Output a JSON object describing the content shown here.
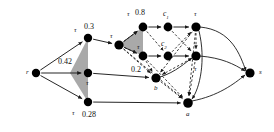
{
  "figure": {
    "type": "directed-graph-diagram",
    "background": "#ffffff",
    "stroke": "#1a1a1a",
    "node_fill": "#000000",
    "shade_fill": "#9a9a9a",
    "width": 274,
    "height": 132
  },
  "nodes": [
    {
      "id": "r",
      "label": "r",
      "x": 36,
      "y": 73,
      "r": 4.2,
      "label_dx": -9,
      "label_dy": -4
    },
    {
      "id": "n1",
      "label": "",
      "x": 88,
      "y": 38,
      "r": 4.2,
      "label_dx": 0,
      "label_dy": 0
    },
    {
      "id": "n2",
      "label": "",
      "x": 88,
      "y": 73,
      "r": 4.2,
      "label_dx": 0,
      "label_dy": 0
    },
    {
      "id": "n3",
      "label": "",
      "x": 88,
      "y": 102,
      "r": 4.2,
      "label_dx": 0,
      "label_dy": 0
    },
    {
      "id": "hub",
      "label": "",
      "x": 119,
      "y": 45,
      "r": 4.6,
      "label_dx": 0,
      "label_dy": 0
    },
    {
      "id": "t08",
      "label": "",
      "x": 143,
      "y": 27,
      "r": 4.4,
      "label_dx": 0,
      "label_dy": 0
    },
    {
      "id": "t2",
      "label": "",
      "x": 143,
      "y": 56,
      "r": 4.4,
      "label_dx": 0,
      "label_dy": 0
    },
    {
      "id": "c1",
      "label": "",
      "x": 168,
      "y": 27,
      "r": 4.4,
      "label_dx": 0,
      "label_dy": 0
    },
    {
      "id": "c2",
      "label": "",
      "x": 168,
      "y": 56,
      "r": 4.4,
      "label_dx": 0,
      "label_dy": 0
    },
    {
      "id": "u1",
      "label": "",
      "x": 196,
      "y": 27,
      "r": 4.6,
      "label_dx": 0,
      "label_dy": 0
    },
    {
      "id": "u2",
      "label": "",
      "x": 196,
      "y": 56,
      "r": 4.6,
      "label_dx": 0,
      "label_dy": 0
    },
    {
      "id": "b",
      "label": "b",
      "x": 156,
      "y": 78,
      "r": 4.6,
      "label_dx": -2,
      "label_dy": 8
    },
    {
      "id": "a",
      "label": "a",
      "x": 188,
      "y": 103,
      "r": 4.8,
      "label_dx": -2,
      "label_dy": 9
    },
    {
      "id": "s",
      "label": "s",
      "x": 250,
      "y": 73,
      "r": 4.6,
      "label_dx": 8,
      "label_dy": -3
    }
  ],
  "labels": [
    {
      "name": "tau-03",
      "text": "τ",
      "kind": "tau",
      "x": 74,
      "y": 27
    },
    {
      "name": "val-03",
      "text": "0.3",
      "kind": "num",
      "x": 84,
      "y": 23
    },
    {
      "name": "val-042",
      "text": "0.42",
      "kind": "num",
      "x": 58,
      "y": 58
    },
    {
      "name": "tau-042",
      "text": "τ",
      "kind": "tau",
      "x": 86,
      "y": 80
    },
    {
      "name": "tau-028",
      "text": "τ",
      "kind": "tau",
      "x": 72,
      "y": 110
    },
    {
      "name": "val-028",
      "text": "0.28",
      "kind": "num",
      "x": 82,
      "y": 111
    },
    {
      "name": "tau-hub",
      "text": "τ",
      "kind": "tau",
      "x": 110,
      "y": 33
    },
    {
      "name": "tau-08",
      "text": "τ",
      "kind": "tau",
      "x": 127,
      "y": 11
    },
    {
      "name": "val-08",
      "text": "0.8",
      "kind": "num",
      "x": 135,
      "y": 9
    },
    {
      "name": "tau-mid",
      "text": "τ",
      "kind": "tau",
      "x": 137,
      "y": 44
    },
    {
      "name": "val-02",
      "text": "0.2",
      "kind": "num",
      "x": 131,
      "y": 66
    },
    {
      "name": "tau-u1",
      "text": "τ",
      "kind": "tau",
      "x": 194,
      "y": 11
    },
    {
      "name": "tau-u2",
      "text": "τ",
      "kind": "tau",
      "x": 194,
      "y": 66
    }
  ],
  "clabels": [
    {
      "name": "c1-label",
      "base": "c",
      "sub": "1",
      "x": 163,
      "y": 10
    },
    {
      "name": "c2-label",
      "base": "c",
      "sub": "2",
      "x": 161,
      "y": 40
    }
  ],
  "node_labels": [
    {
      "name": "node-label-r",
      "text": "r",
      "x": 26,
      "y": 69
    },
    {
      "name": "node-label-b",
      "text": "b",
      "x": 154,
      "y": 85
    },
    {
      "name": "node-label-a",
      "text": "a",
      "x": 186,
      "y": 111
    },
    {
      "name": "node-label-s",
      "text": "s",
      "x": 259,
      "y": 69
    }
  ],
  "solid_edges": [
    {
      "from": "r",
      "to": "n1",
      "name": "edge-r-n1"
    },
    {
      "from": "r",
      "to": "n2",
      "name": "edge-r-n2"
    },
    {
      "from": "r",
      "to": "n3",
      "name": "edge-r-n3"
    },
    {
      "from": "n1",
      "to": "hub",
      "name": "edge-n1-hub"
    },
    {
      "from": "hub",
      "to": "t08",
      "name": "edge-hub-t08"
    },
    {
      "from": "hub",
      "to": "t2",
      "name": "edge-hub-t2"
    },
    {
      "from": "t08",
      "to": "c1",
      "name": "edge-t08-c1"
    },
    {
      "from": "c1",
      "to": "u1",
      "name": "edge-c1-u1"
    },
    {
      "from": "t2",
      "to": "c2",
      "name": "edge-t2-c2"
    },
    {
      "from": "c2",
      "to": "u2",
      "name": "edge-c2-u2"
    },
    {
      "from": "n2",
      "to": "b",
      "name": "edge-n2-b"
    },
    {
      "from": "n3",
      "to": "a",
      "name": "edge-n3-a"
    }
  ],
  "dashed_edges": [
    {
      "from": "hub",
      "to": "t08",
      "name": "dashed-hub-t08"
    },
    {
      "from": "hub",
      "to": "t2",
      "name": "dashed-hub-t2"
    },
    {
      "from": "hub",
      "to": "b",
      "name": "dashed-hub-b"
    },
    {
      "from": "hub",
      "to": "a",
      "name": "dashed-hub-a"
    },
    {
      "from": "t08",
      "to": "c2",
      "name": "dashed-t08-c2"
    },
    {
      "from": "t2",
      "to": "b",
      "name": "dashed-t2-b"
    },
    {
      "from": "c1",
      "to": "u2",
      "name": "dashed-c1-u2"
    },
    {
      "from": "c2",
      "to": "u1",
      "name": "dashed-c2-u1"
    },
    {
      "from": "u1",
      "to": "u2",
      "name": "dashed-u1-u2"
    },
    {
      "from": "u1",
      "to": "b",
      "name": "dashed-u1-b"
    },
    {
      "from": "u1",
      "to": "a",
      "name": "dashed-u1-a"
    },
    {
      "from": "u2",
      "to": "a",
      "name": "dashed-u2-a"
    },
    {
      "from": "u2",
      "to": "b",
      "name": "dashed-u2-b"
    },
    {
      "from": "b",
      "to": "a",
      "name": "dashed-b-a"
    },
    {
      "from": "t2",
      "to": "a",
      "name": "dashed-t2-a"
    }
  ],
  "shaded_regions": [
    {
      "name": "shade-left-triangle",
      "points": "88,38 88,102 70,73"
    },
    {
      "name": "shade-hub-triangle",
      "points": "119,45 143,27 143,56"
    }
  ],
  "curved_edges": [
    {
      "name": "curve-u1-s",
      "d": "M 200,27 C 232,30 240,55 246,71"
    },
    {
      "name": "curve-u2-s",
      "d": "M 200,56 C 222,58 234,64 245,71"
    },
    {
      "name": "curve-a-s",
      "d": "M 192,101 C 218,96 234,84 245,75"
    },
    {
      "name": "curve-u1-a",
      "d": "M 199,31 C 206,60 200,88 192,99"
    },
    {
      "name": "curve-b-out",
      "d": "M 160,77 C 176,72 186,62 192,58"
    }
  ]
}
